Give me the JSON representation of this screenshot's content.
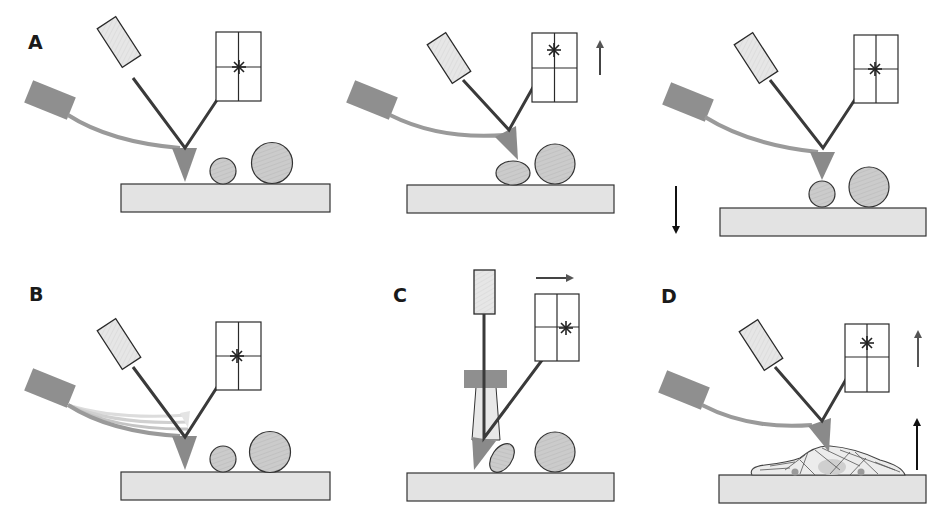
{
  "figure": {
    "colors": {
      "background": "#ffffff",
      "cantilever": "#8f8f8f",
      "tip": "#8a8a8a",
      "laser_body": "#e6e6e6",
      "beam": "#3a3a3a",
      "substrate": "#e3e3e3",
      "particle": "#c8c8c8",
      "outline": "#2a2a2a",
      "arrow_dark": "#111111",
      "arrow_gray": "#555555"
    },
    "panels": [
      {
        "id": "A1",
        "label": "A",
        "state": "tip at rest above surface",
        "detector_spot": "center",
        "arrow": "none"
      },
      {
        "id": "A2",
        "label": "",
        "state": "tip deflected upward by deformed particle",
        "detector_spot": "upper",
        "arrow": "up"
      },
      {
        "id": "A3",
        "label": "",
        "state": "sample stage lowered",
        "detector_spot": "center",
        "arrow": "down"
      },
      {
        "id": "B",
        "label": "B",
        "state": "oscillating cantilever (tapping/dynamic mode)",
        "detector_spot": "center",
        "arrow": "none"
      },
      {
        "id": "C",
        "label": "C",
        "state": "lateral/torsional deflection pushing particle",
        "detector_spot": "right",
        "arrow": "right"
      },
      {
        "id": "D",
        "label": "D",
        "state": "tip indenting a living cell on substrate",
        "detector_spot": "upper",
        "arrow": "up (two arrows)"
      }
    ]
  },
  "labels": {
    "A": "A",
    "B": "B",
    "C": "C",
    "D": "D"
  }
}
